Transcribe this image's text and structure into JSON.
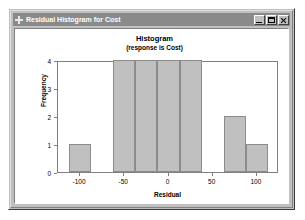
{
  "window": {
    "title": "Residual Histogram for Cost",
    "icon": "crosshair-icon",
    "buttons": {
      "minimize": "minimize-button",
      "maximize": "maximize-button",
      "close": "close-button"
    }
  },
  "chart_data": {
    "type": "bar",
    "title": "Histogram",
    "subtitle": "(response is Cost)",
    "xlabel": "Residual",
    "ylabel": "Frequency",
    "xlim": [
      -125,
      125
    ],
    "ylim": [
      0,
      4
    ],
    "xticks": [
      "-100",
      "-50",
      "0",
      "50",
      "100"
    ],
    "xtick_values": [
      -100,
      -50,
      0,
      50,
      100
    ],
    "yticks": [
      "0",
      "1",
      "2",
      "3",
      "4"
    ],
    "ytick_values": [
      0,
      1,
      2,
      3,
      4
    ],
    "grid": false,
    "legend": null,
    "bin_width": 25,
    "bar_color": "#c0c0c0",
    "bar_edge_color": "#8c8c8c",
    "bins": [
      {
        "label": "-112.5 to -87.5",
        "left": -112.5,
        "right": -87.5,
        "value": 1
      },
      {
        "label": "-62.5 to -37.5",
        "left": -62.5,
        "right": -37.5,
        "value": 4
      },
      {
        "label": "-37.5 to -12.5",
        "left": -37.5,
        "right": -12.5,
        "value": 4
      },
      {
        "label": "-12.5 to 12.5",
        "left": -12.5,
        "right": 12.5,
        "value": 4
      },
      {
        "label": "12.5 to 37.5",
        "left": 12.5,
        "right": 37.5,
        "value": 4
      },
      {
        "label": "62.5 to 87.5",
        "left": 62.5,
        "right": 87.5,
        "value": 2
      },
      {
        "label": "87.5 to 112.5",
        "left": 87.5,
        "right": 112.5,
        "value": 1
      }
    ],
    "categories": [
      "-112.5 to -87.5",
      "-62.5 to -37.5",
      "-37.5 to -12.5",
      "-12.5 to 12.5",
      "12.5 to 37.5",
      "62.5 to 87.5",
      "87.5 to 112.5"
    ],
    "values": [
      1,
      4,
      4,
      4,
      4,
      2,
      1
    ]
  }
}
